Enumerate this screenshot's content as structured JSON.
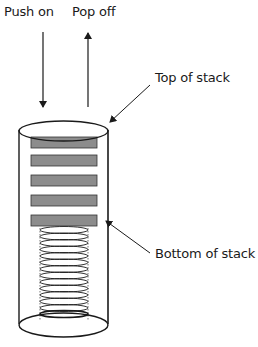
{
  "diagram": {
    "type": "stack-illustration",
    "labels": {
      "push": "Push on",
      "pop": "Pop off",
      "top": "Top of stack",
      "bottom": "Bottom of stack"
    },
    "plate_count": 5,
    "spring_coil_count": 14,
    "colors": {
      "stroke": "#1a1a1a",
      "plate_fill": "#8c8c8c",
      "background": "#ffffff"
    }
  }
}
